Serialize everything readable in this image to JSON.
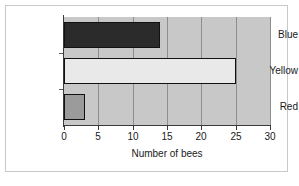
{
  "chart_data": {
    "type": "bar",
    "orientation": "horizontal",
    "title": "",
    "xlabel": "Number of bees",
    "ylabel": "",
    "categories": [
      "Blue",
      "Yellow",
      "Red"
    ],
    "values": [
      14,
      25,
      3
    ],
    "series": [
      {
        "name": "Number of bees",
        "values": [
          14,
          25,
          3
        ]
      }
    ],
    "xlim": [
      0,
      30
    ],
    "xticks": [
      0,
      5,
      10,
      15,
      20,
      25,
      30
    ],
    "xtick_labels": [
      "0",
      "5",
      "10",
      "15",
      "20",
      "25",
      "30"
    ],
    "grid": "vertical",
    "legend": "none",
    "bar_colors": [
      "#2b2b2b",
      "#e9e9e9",
      "#9b9b9b"
    ],
    "bar_edge_color": "#111111",
    "plot_background": "#c8c8c8",
    "figure_background": "#ffffff",
    "frame_color": "#c9c9c9"
  }
}
